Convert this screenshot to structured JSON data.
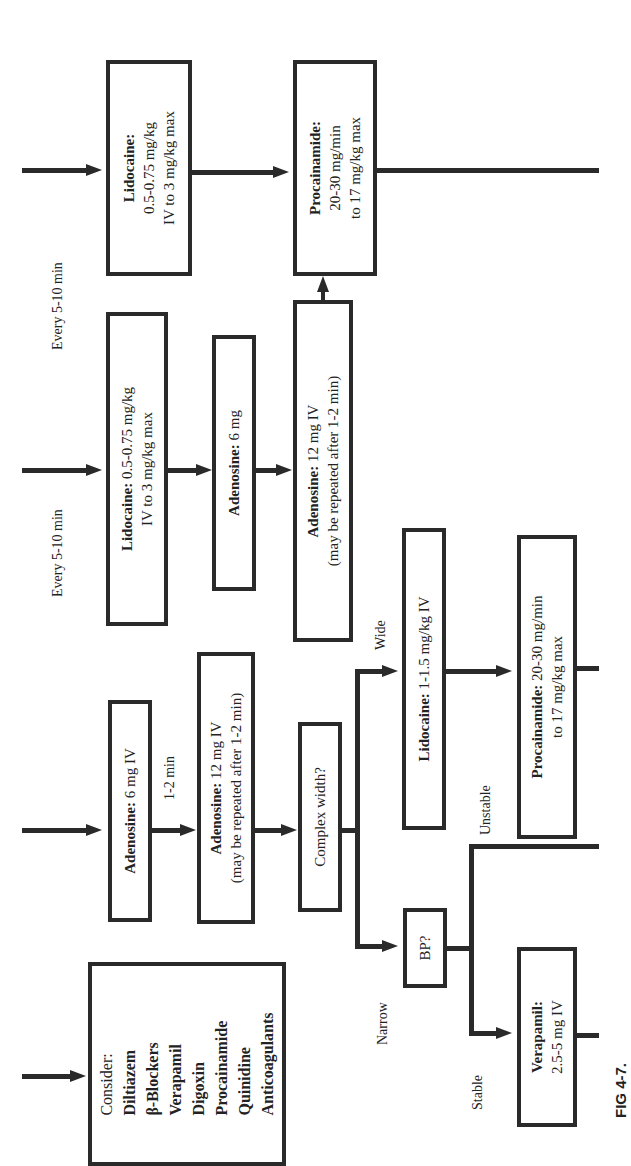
{
  "figure_label": "FIG 4-7.",
  "columns": {
    "col1": {
      "interval_label": "Every 5-10 min",
      "lidocaine": {
        "title": "Lidocaine:",
        "line1": "0.5-0.75 mg/kg",
        "line2": "IV to 3 mg/kg max"
      },
      "procainamide": {
        "title": "Procainamide:",
        "line1": "20-30 mg/min",
        "line2": "to 17 mg/kg max"
      }
    },
    "col2": {
      "interval_label": "Every 5-10 min",
      "lidocaine": {
        "title": "Lidocaine:",
        "line1": " 0.5-0.75 mg/kg",
        "line2": "IV to 3 mg/kg max"
      },
      "adenosine6": {
        "title": "Adenosine:",
        "line1": " 6 mg"
      },
      "adenosine12": {
        "title": "Adenosine:",
        "line1": " 12 mg IV",
        "line2": "(may be repeated after 1-2 min)"
      }
    },
    "col3": {
      "adenosine6": {
        "title": "Adenosine:",
        "line1": " 6 mg  IV"
      },
      "interval_label": "1-2 min",
      "adenosine12": {
        "title": "Adenosine:",
        "line1": " 12 mg IV",
        "line2": "(may be repeated after 1-2 min)"
      },
      "complex_width": "Complex width?",
      "wide_label": "Wide",
      "narrow_label": "Narrow",
      "lidocaine": {
        "title": "Lidocaine:",
        "line1": " 1-1.5 mg/kg IV"
      },
      "procainamide": {
        "title": "Procainamide:",
        "line1": " 20-30 mg/min",
        "line2": "to 17 mg/kg max"
      },
      "bp": "BP?",
      "unstable_label": "Unstable",
      "stable_label": "Stable",
      "verapamil": {
        "title": "Verapamil:",
        "line1": "2.5-5 mg IV"
      }
    },
    "col4": {
      "consider": {
        "title": "Consider:",
        "items": [
          "Diltiazem",
          "β-Blockers",
          "Verapamil",
          "Digoxin",
          "Procainamide",
          "Quinidine",
          "Anticoagulants"
        ]
      }
    }
  }
}
